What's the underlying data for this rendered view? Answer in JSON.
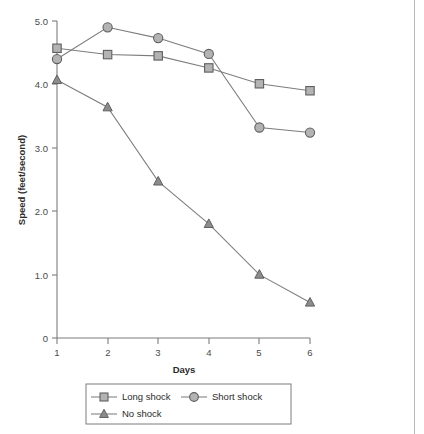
{
  "chart_data": {
    "type": "line",
    "title": "",
    "xlabel": "Days",
    "ylabel": "Speed (feet/second)",
    "x": [
      1,
      2,
      3,
      4,
      5,
      6
    ],
    "categories": [
      "1",
      "2",
      "3",
      "4",
      "5",
      "6"
    ],
    "xlim": [
      1,
      6
    ],
    "ylim": [
      0,
      5.0
    ],
    "grid": false,
    "legend_position": "bottom",
    "xtick_labels": [
      "1",
      "2",
      "3",
      "4",
      "5",
      "6"
    ],
    "ytick_labels": [
      "0",
      "1.0",
      "2.0",
      "3.0",
      "4.0",
      "5.0"
    ],
    "ytick_values": [
      0,
      1.0,
      2.0,
      3.0,
      4.0,
      5.0
    ],
    "series": [
      {
        "name": "Long shock",
        "marker": "square",
        "values": [
          4.57,
          4.47,
          4.45,
          4.26,
          4.01,
          3.9
        ]
      },
      {
        "name": "Short shock",
        "marker": "circle",
        "values": [
          4.4,
          4.9,
          4.73,
          4.48,
          3.32,
          3.24
        ]
      },
      {
        "name": "No shock",
        "marker": "triangle",
        "values": [
          4.07,
          3.64,
          2.47,
          1.8,
          1.0,
          0.56
        ]
      }
    ]
  },
  "legend": {
    "entries": [
      {
        "label": "Long shock",
        "marker": "square"
      },
      {
        "label": "Short shock",
        "marker": "circle"
      },
      {
        "label": "No shock",
        "marker": "triangle"
      }
    ]
  },
  "colors": {
    "marker_fill": "#b3b3b3",
    "marker_fill_dark": "#8c8c8c",
    "marker_stroke": "#5f5f5f",
    "line": "#7d7d7d",
    "axis": "#7d7d7d",
    "text": "#2b2b2b",
    "tick_text": "#4a4a4a",
    "background": "#ffffff",
    "page_border": "#b8b8b8"
  }
}
